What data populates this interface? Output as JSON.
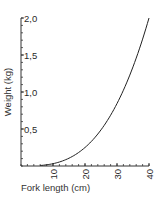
{
  "chart_data": {
    "type": "line",
    "title": "",
    "xlabel": "Fork length (cm)",
    "ylabel": "Weight (kg)",
    "xlim": [
      0,
      40
    ],
    "ylim": [
      0,
      2.0
    ],
    "x_ticks": [
      10,
      20,
      30,
      40
    ],
    "x_tick_labels": [
      "10",
      "20",
      "30",
      "40"
    ],
    "y_ticks": [
      0.5,
      1.0,
      1.5,
      2.0
    ],
    "y_tick_labels": [
      "0,5",
      "1,0",
      "1,5",
      "2,0"
    ],
    "x_minor_step": 2,
    "y_minor_step": 0.1,
    "grid": false,
    "legend": null,
    "series": [
      {
        "name": "Weight-length curve",
        "x": [
          0,
          5,
          8,
          10,
          15,
          20,
          25,
          30,
          35,
          40
        ],
        "values": [
          0.0,
          0.004,
          0.016,
          0.031,
          0.105,
          0.25,
          0.49,
          0.84,
          1.34,
          2.0
        ]
      }
    ],
    "color": "#222222"
  }
}
